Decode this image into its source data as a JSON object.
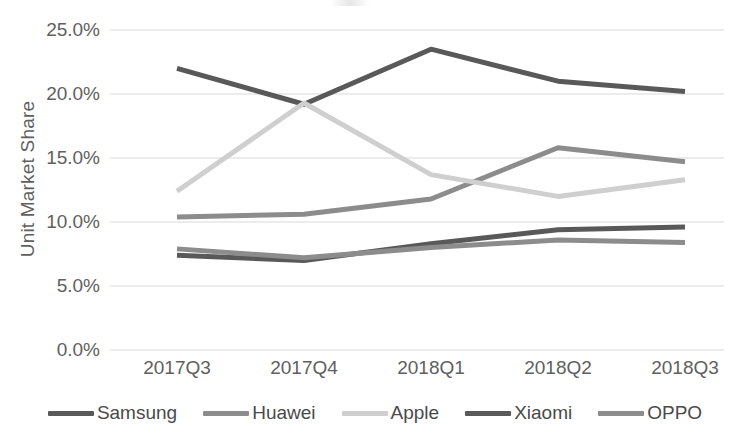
{
  "chart_data": {
    "type": "line",
    "title": "",
    "xlabel": "",
    "ylabel": "Unit Market Share",
    "categories": [
      "2017Q3",
      "2017Q4",
      "2018Q1",
      "2018Q2",
      "2018Q3"
    ],
    "ylim": [
      0,
      25
    ],
    "ytick_labels": [
      "25.0%",
      "20.0%",
      "15.0%",
      "10.0%",
      "5.0%",
      "0.0%"
    ],
    "ytick_values": [
      25,
      20,
      15,
      10,
      5,
      0
    ],
    "grid": "horizontal",
    "legend_position": "bottom",
    "series": [
      {
        "name": "Samsung",
        "color": "#595959",
        "values": [
          22.0,
          19.2,
          23.5,
          21.0,
          20.2
        ]
      },
      {
        "name": "Huawei",
        "color": "#8c8c8c",
        "values": [
          10.4,
          10.6,
          11.8,
          15.8,
          14.7
        ]
      },
      {
        "name": "Apple",
        "color": "#cfcfcf",
        "values": [
          12.4,
          19.3,
          13.7,
          12.0,
          13.3
        ]
      },
      {
        "name": "Xiaomi",
        "color": "#595959",
        "values": [
          7.4,
          7.0,
          8.3,
          9.4,
          9.6
        ]
      },
      {
        "name": "OPPO",
        "color": "#8c8c8c",
        "values": [
          7.9,
          7.2,
          8.0,
          8.6,
          8.4
        ]
      }
    ]
  },
  "axis": {
    "y_title": "Unit Market Share"
  },
  "legend": {
    "items": [
      {
        "label": "Samsung"
      },
      {
        "label": "Huawei"
      },
      {
        "label": "Apple"
      },
      {
        "label": "Xiaomi"
      },
      {
        "label": "OPPO"
      }
    ]
  },
  "style": {
    "gridline_color": "#d9d9d9",
    "text_color": "#606060",
    "background": "#ffffff"
  }
}
